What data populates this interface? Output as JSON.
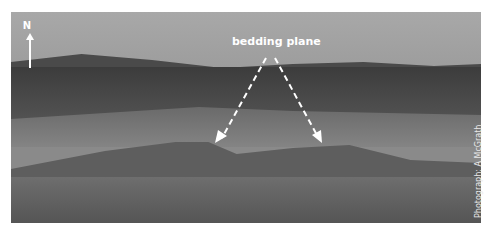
{
  "figure": {
    "annotation_label": "bedding plane",
    "north_label": "N",
    "credit": "Photograph: A McGrath"
  }
}
